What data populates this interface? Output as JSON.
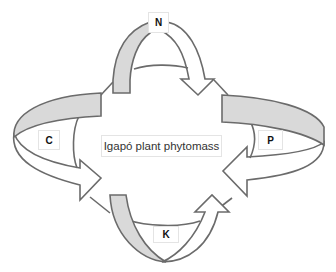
{
  "diagram": {
    "center_label": "Igapó plant phytomass",
    "nutrients": [
      {
        "id": "N",
        "label": "N",
        "position": "top"
      },
      {
        "id": "C",
        "label": "C",
        "position": "left"
      },
      {
        "id": "P",
        "label": "P",
        "position": "right"
      },
      {
        "id": "K",
        "label": "K",
        "position": "bottom"
      }
    ],
    "colors": {
      "outline": "#6b6b6b",
      "band_fill": "#d9d9d9",
      "arrow_fill": "#ffffff",
      "background": "#ffffff"
    }
  }
}
